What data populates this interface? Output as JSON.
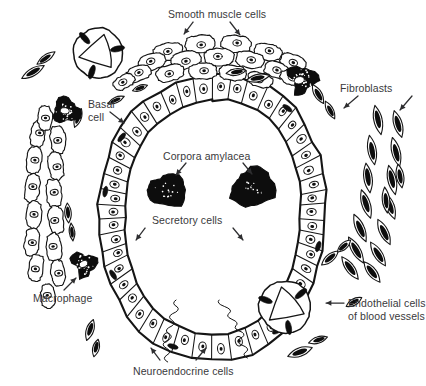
{
  "figure": {
    "background_color": "#ffffff",
    "ink_color": "#151515",
    "text_color": "#39393b",
    "width": 424,
    "height": 386
  },
  "labels": {
    "smooth_muscle": {
      "text": "Smooth muscle cells",
      "x": 168,
      "y": 8,
      "arrows": 2
    },
    "fibroblasts": {
      "text": "Fibroblasts",
      "x": 340,
      "y": 82,
      "arrows": 2
    },
    "basal_cell_line1": {
      "text": "Basal",
      "x": 88,
      "y": 98
    },
    "basal_cell_line2": {
      "text": "cell",
      "x": 88,
      "y": 111,
      "arrows": 1
    },
    "corpora_amylacea": {
      "text": "Corpora amylacea",
      "x": 163,
      "y": 150,
      "arrows": 2
    },
    "secretory_cells": {
      "text": "Secretory cells",
      "x": 152,
      "y": 214,
      "arrows": 2
    },
    "macrophage": {
      "text": "Macrophage",
      "x": 33,
      "y": 292,
      "arrows": 1
    },
    "endothelial_line1": {
      "text": "Endothelial cells",
      "x": 348,
      "y": 297,
      "arrows": 1
    },
    "endothelial_line2": {
      "text": "of blood vessels",
      "x": 348,
      "y": 310
    },
    "neuroendocrine": {
      "text": "Neuroendocrine cells",
      "x": 133,
      "y": 365,
      "arrows": 2
    }
  },
  "structures": {
    "acinus": {
      "name": "glandular acinus ring of columnar epithelium",
      "cell_count": 46
    },
    "corpora_amylacea_bodies": {
      "count": 2,
      "color": "#0d0d0d"
    },
    "blood_vessels": {
      "count": 2,
      "note": "circular cross sections with triangular lumen and dark endothelial nuclei"
    },
    "macrophages": {
      "count": 3,
      "note": "dark stippled irregular blobs with pale nucleus"
    },
    "smooth_muscle_clusters": {
      "count": 2,
      "note": "top arc band and left vertical column"
    },
    "fibroblast_cluster": {
      "count": 1,
      "note": "right side fan of elongated spindle cells"
    },
    "nerve_fibers": {
      "count": 2,
      "note": "wavy unmyelinated axons descending from acinus base"
    }
  }
}
